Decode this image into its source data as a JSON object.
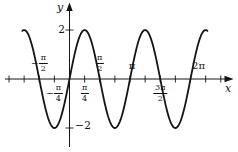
{
  "chart_data": {
    "type": "line",
    "curve": "sinusoid",
    "equation_inferred": "y = 2 sin 2x",
    "amplitude": 2,
    "period": "π",
    "x_domain_pi": [
      -0.78,
      2.28
    ],
    "x_axis": {
      "label": "x",
      "ticks_pi": [
        -1,
        -0.75,
        -0.5,
        -0.25,
        0.25,
        0.5,
        0.75,
        1,
        1.25,
        1.5,
        1.75,
        2,
        2.25,
        2.5
      ],
      "labeled_ticks": [
        "−π/2",
        "−π/4",
        "π/4",
        "π/2",
        "π",
        "3π/2",
        "2π"
      ]
    },
    "y_axis": {
      "label": "y",
      "ticks": [
        2,
        -2
      ]
    },
    "key_points_x_pi_y": [
      [
        -0.75,
        2
      ],
      [
        -0.5,
        0
      ],
      [
        -0.25,
        -2
      ],
      [
        0,
        0
      ],
      [
        0.25,
        2
      ],
      [
        0.5,
        0
      ],
      [
        0.75,
        -2
      ],
      [
        1,
        0
      ],
      [
        1.25,
        2
      ],
      [
        1.5,
        0
      ],
      [
        1.75,
        -2
      ],
      [
        2,
        0
      ],
      [
        2.25,
        2
      ]
    ],
    "grid": false,
    "legend": false
  },
  "labels": {
    "y_axis": "y",
    "x_axis": "x",
    "y_top": "2",
    "y_bottom": "−2",
    "x_tick_labels": [
      {
        "id": "neg-pi-over-2",
        "pos_pi": -0.5,
        "side": "above",
        "sign": "−",
        "num": "π",
        "den": "2"
      },
      {
        "id": "neg-pi-over-4",
        "pos_pi": -0.25,
        "side": "below",
        "sign": "−",
        "num": "π",
        "den": "4"
      },
      {
        "id": "pi-over-4",
        "pos_pi": 0.25,
        "side": "below",
        "sign": "",
        "num": "π",
        "den": "4"
      },
      {
        "id": "pi-over-2",
        "pos_pi": 0.5,
        "side": "above",
        "sign": "",
        "num": "π",
        "den": "2"
      },
      {
        "id": "pi",
        "pos_pi": 1,
        "side": "above",
        "text": "π"
      },
      {
        "id": "3pi-over-2",
        "pos_pi": 1.5,
        "side": "below",
        "sign": "",
        "num": "3π",
        "den": "2"
      },
      {
        "id": "2pi",
        "pos_pi": 2,
        "side": "above",
        "text": "2π"
      }
    ]
  }
}
